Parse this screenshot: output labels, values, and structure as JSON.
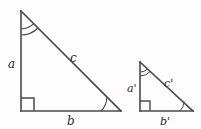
{
  "figure": {
    "background_color": "#fdfdfd",
    "stroke_color": "#4a4a4a",
    "label_color": "#2b2b2b"
  },
  "shapes": {
    "large_triangle": {
      "name": "large right triangle",
      "vertices": {
        "apex": [
          21,
          11
        ],
        "right_angle": [
          21,
          111
        ],
        "base_right": [
          121,
          111
        ]
      },
      "labels": {
        "leg_vertical": "a",
        "hypotenuse": "c",
        "leg_base": "b"
      },
      "markers": {
        "apex_angle": "double-arc",
        "base_right_angle": "single-arc",
        "right_angle": "square"
      }
    },
    "small_triangle": {
      "name": "small right triangle",
      "vertices": {
        "apex": [
          140,
          62
        ],
        "right_angle": [
          140,
          111
        ],
        "base_right": [
          193,
          111
        ]
      },
      "labels": {
        "leg_vertical": "a'",
        "hypotenuse": "c'",
        "leg_base": "b'"
      },
      "markers": {
        "apex_angle": "double-arc",
        "base_right_angle": "single-arc",
        "right_angle": "square"
      }
    }
  }
}
